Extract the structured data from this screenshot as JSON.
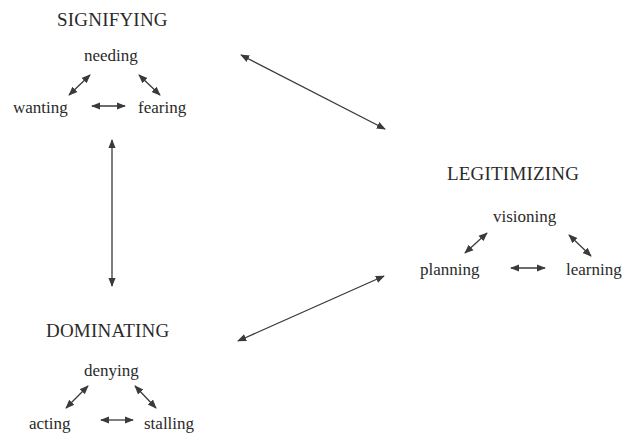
{
  "groups": {
    "signifying": {
      "title": "SIGNIFYING",
      "top": "needing",
      "left": "wanting",
      "right": "fearing"
    },
    "legitimizing": {
      "title": "LEGITIMIZING",
      "top": "visioning",
      "left": "planning",
      "right": "learning"
    },
    "dominating": {
      "title": "DOMINATING",
      "top": "denying",
      "left": "acting",
      "right": "stalling"
    }
  },
  "connections": [
    {
      "from": "signifying",
      "to": "legitimizing",
      "type": "bidirectional"
    },
    {
      "from": "signifying",
      "to": "dominating",
      "type": "bidirectional"
    },
    {
      "from": "dominating",
      "to": "legitimizing",
      "type": "bidirectional"
    }
  ],
  "colors": {
    "text": "#2a2a2a",
    "arrow": "#3a3a3a",
    "background": "#ffffff"
  }
}
